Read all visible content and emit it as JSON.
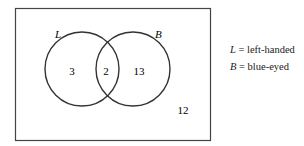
{
  "diagram": {
    "type": "venn",
    "sets": [
      {
        "label": "L",
        "meaning": "left-handed",
        "only_count": "3"
      },
      {
        "label": "B",
        "meaning": "blue-eyed",
        "only_count": "13"
      }
    ],
    "intersection_count": "2",
    "outside_count": "12"
  },
  "legend": [
    {
      "symbol": "L",
      "text": " = left-handed"
    },
    {
      "symbol": "B",
      "text": " = blue-eyed"
    }
  ],
  "colors": {
    "stroke": "#333333",
    "background": "#ffffff"
  }
}
